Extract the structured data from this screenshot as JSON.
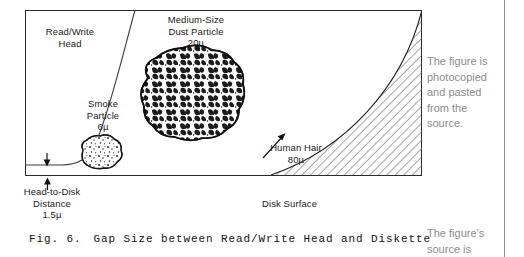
{
  "figure": {
    "frame": {
      "x": 25,
      "y": 10,
      "width": 397,
      "height": 166
    },
    "labels": {
      "read_write_head": {
        "line1": "Read/Write",
        "line2": "Head"
      },
      "dust_particle": {
        "line1": "Medium-Size",
        "line2": "Dust Particle",
        "line3": "20µ"
      },
      "smoke_particle": {
        "line1": "Smoke",
        "line2": "Particle",
        "line3": "6µ"
      },
      "head_to_disk": {
        "line1": "Head-to-Disk",
        "line2": "Distance",
        "line3": "1.5µ"
      },
      "human_hair": {
        "line1": "Human Hair",
        "line2": "80µ"
      },
      "disk_surface": {
        "line1": "Disk Surface"
      }
    },
    "caption": {
      "number": "Fig. 6.",
      "text": "Gap Size between Read/Write Head and Diskette"
    },
    "colors": {
      "ink": "#111111",
      "hatch": "#4a4a4a",
      "rule": "#8d8d8d",
      "note": "#8b8b8b",
      "background": "#ffffff"
    }
  },
  "notes": {
    "photocopied": {
      "line1": "The figure is",
      "line2": "photocopied",
      "line3": "and pasted",
      "line4": "from the",
      "line5": "source."
    },
    "source": {
      "line1": "The figure’s",
      "line2": "source is"
    }
  }
}
